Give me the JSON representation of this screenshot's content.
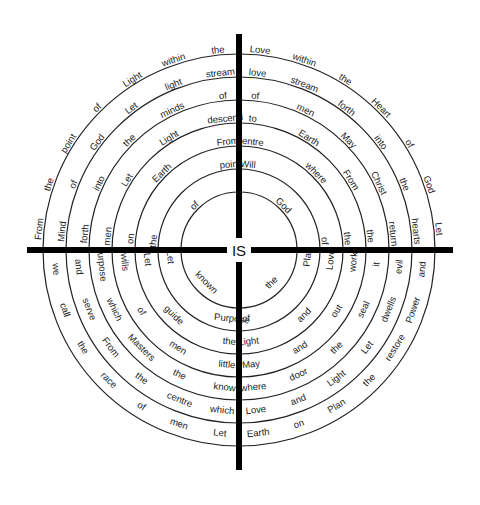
{
  "diagram": {
    "center_label": "IS",
    "cross": {
      "color": "#000000",
      "h_from": 27,
      "h_to": 453,
      "v_from": 34,
      "v_to": 470,
      "thickness": 6
    },
    "center": [
      239,
      250
    ],
    "rings": [
      {
        "radius": 58,
        "quadrants": {
          "top_left": [
            "of"
          ],
          "top_right": [
            "God"
          ],
          "bottom_left": [
            "known"
          ],
          "bottom_right": [
            "the"
          ]
        }
      },
      {
        "radius": 81,
        "quadrants": {
          "top_left": [
            "the",
            "point"
          ],
          "top_right": [
            "Will",
            "of"
          ],
          "bottom_left": [
            "Purpose",
            "Let"
          ],
          "bottom_right": [
            "Plan",
            "of"
          ]
        }
      },
      {
        "radius": 104,
        "quadrants": {
          "top_left": [
            "on",
            "Earth",
            "From"
          ],
          "top_right": [
            "centre",
            "where",
            "the"
          ],
          "bottom_left": [
            "the",
            "guide",
            "Let"
          ],
          "bottom_right": [
            "Love",
            "and",
            "Light"
          ]
        }
      },
      {
        "radius": 127,
        "quadrants": {
          "top_left": [
            "men",
            "Let",
            "Light",
            "descend"
          ],
          "top_right": [
            "to",
            "Earth",
            "From",
            "the"
          ],
          "bottom_left": [
            "little",
            "men",
            "of",
            "wills"
          ],
          "bottom_right": [
            "work",
            "out",
            "and",
            "May"
          ]
        }
      },
      {
        "radius": 150,
        "quadrants": {
          "top_left": [
            "forth",
            "into",
            "the",
            "minds",
            "of"
          ],
          "top_right": [
            "of",
            "men",
            "May",
            "Christ",
            "return"
          ],
          "bottom_left": [
            "know",
            "the",
            "Masters",
            "which",
            "purpose"
          ],
          "bottom_right": [
            "it",
            "seal",
            "the",
            "door",
            "where"
          ]
        }
      },
      {
        "radius": 173,
        "quadrants": {
          "top_left": [
            "Mind",
            "of",
            "God",
            "Let",
            "light",
            "stream"
          ],
          "top_right": [
            "love",
            "stream",
            "forth",
            "into",
            "the",
            "hearts"
          ],
          "bottom_left": [
            "which",
            "centre",
            "the",
            "From",
            "serve",
            "and"
          ],
          "bottom_right": [
            "evil",
            "dwells",
            "Let",
            "Light",
            "and",
            "Love"
          ]
        }
      },
      {
        "radius": 196,
        "quadrants": {
          "top_left": [
            "From",
            "the",
            "point",
            "of",
            "Light",
            "within",
            "the"
          ],
          "top_right": [
            "Love",
            "within",
            "the",
            "Heart",
            "of",
            "God",
            "Let"
          ],
          "bottom_left": [
            "Let",
            "men",
            "of",
            "race",
            "the",
            "call",
            "we"
          ],
          "bottom_right": [
            "and",
            "Power",
            "restore",
            "the",
            "Plan",
            "on",
            "Earth"
          ]
        }
      }
    ]
  }
}
